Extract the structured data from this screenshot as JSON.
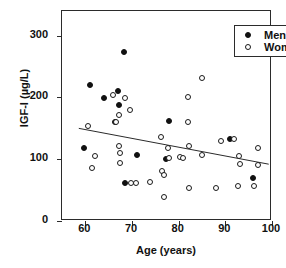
{
  "chart_data": {
    "type": "scatter",
    "title": "",
    "xlabel": "Age (years)",
    "ylabel": "IGF-I (µg/L)",
    "xlim": [
      55,
      100
    ],
    "ylim": [
      0,
      340
    ],
    "xticks": [
      60,
      70,
      80,
      90,
      100
    ],
    "yticks": [
      0,
      100,
      200,
      300
    ],
    "grid": false,
    "legend_position": "top-right",
    "series": [
      {
        "name": "Men",
        "marker": "filled-circle",
        "color": "#111111",
        "points": [
          [
            59.8,
            118
          ],
          [
            61.0,
            220
          ],
          [
            63.9,
            199
          ],
          [
            66.3,
            160
          ],
          [
            66.9,
            211
          ],
          [
            67.3,
            188
          ],
          [
            68.2,
            273
          ],
          [
            68.6,
            62
          ],
          [
            71.0,
            107
          ],
          [
            77.3,
            101
          ],
          [
            78.0,
            162
          ],
          [
            91.0,
            133
          ],
          [
            96.0,
            69
          ]
        ]
      },
      {
        "name": "Women",
        "marker": "open-circle",
        "color": "#1a1a1a",
        "points": [
          [
            60.6,
            154
          ],
          [
            61.5,
            86
          ],
          [
            62.0,
            105
          ],
          [
            65.9,
            204
          ],
          [
            66.6,
            160
          ],
          [
            67.2,
            171
          ],
          [
            67.3,
            122
          ],
          [
            67.4,
            110
          ],
          [
            67.5,
            94
          ],
          [
            68.5,
            199
          ],
          [
            69.6,
            180
          ],
          [
            69.8,
            62
          ],
          [
            70.9,
            62
          ],
          [
            73.9,
            63
          ],
          [
            76.2,
            136
          ],
          [
            76.5,
            81
          ],
          [
            76.8,
            74
          ],
          [
            76.9,
            39
          ],
          [
            77.7,
            118
          ],
          [
            78.0,
            102
          ],
          [
            80.2,
            103
          ],
          [
            81.0,
            102
          ],
          [
            82.0,
            201
          ],
          [
            82.1,
            160
          ],
          [
            82.2,
            121
          ],
          [
            82.3,
            53
          ],
          [
            84.9,
            232
          ],
          [
            85.0,
            107
          ],
          [
            88.0,
            54
          ],
          [
            89.0,
            129
          ],
          [
            91.8,
            133
          ],
          [
            92.8,
            56
          ],
          [
            93.0,
            105
          ],
          [
            93.2,
            93
          ],
          [
            96.2,
            57
          ],
          [
            96.9,
            118
          ],
          [
            97.0,
            91
          ]
        ]
      }
    ],
    "trendline": {
      "name": "regression-line",
      "x_start": 58.6,
      "y_start": 150,
      "x_end": 99.3,
      "y_end": 92,
      "color": "#2b2b2b"
    }
  },
  "legend": {
    "items": [
      {
        "label": "Men",
        "marker": "filled-circle"
      },
      {
        "label": "Women",
        "marker": "open-circle"
      }
    ]
  },
  "axes": {
    "x_tick_labels": [
      "60",
      "70",
      "80",
      "90",
      "100"
    ],
    "y_tick_labels": [
      "0",
      "100",
      "200",
      "300"
    ],
    "x_title": "Age (years)",
    "y_title": "IGF-I (µg/L)"
  }
}
